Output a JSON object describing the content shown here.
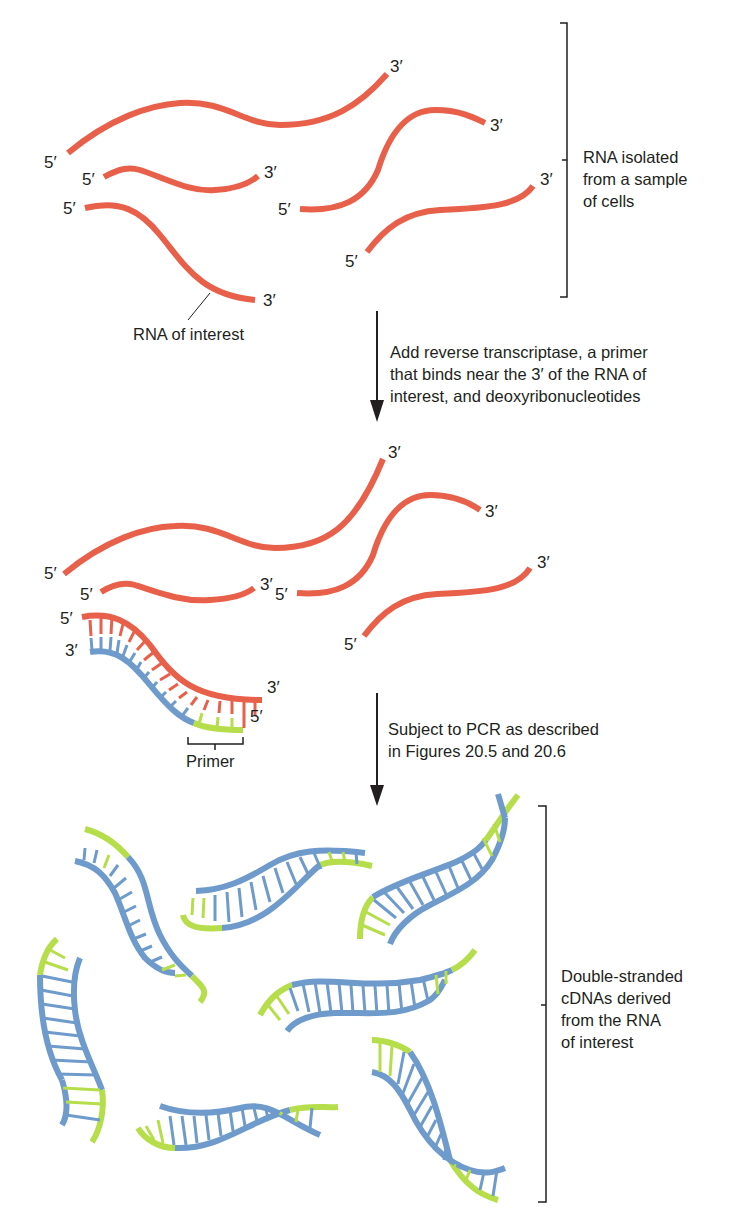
{
  "figure": {
    "section1": {
      "caption_lines": [
        "RNA isolated",
        "from a sample",
        "of cells"
      ],
      "pointer_label": "RNA of interest",
      "end_labels": {
        "five_prime": "5′",
        "three_prime": "3′"
      }
    },
    "step1": {
      "caption_lines": [
        "Add reverse transcriptase, a primer",
        "that binds near the 3′ of the RNA of",
        "interest, and deoxyribonucleotides"
      ]
    },
    "section2": {
      "primer_label": "Primer",
      "end_labels": {
        "five_prime": "5′",
        "three_prime": "3′"
      }
    },
    "step2": {
      "caption_lines": [
        "Subject to PCR as described",
        "in Figures 20.5 and 20.6"
      ]
    },
    "section3": {
      "caption_lines": [
        "Double-stranded",
        "cDNAs derived",
        "from the RNA",
        "of interest"
      ]
    },
    "colors": {
      "rna": "#e8604a",
      "cdna": "#6e9bcb",
      "primer": "#b6dd4a",
      "text": "#231f20"
    }
  }
}
